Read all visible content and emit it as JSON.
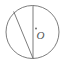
{
  "figure": {
    "kind": "geometry-diagram",
    "canvas": {
      "width": 70,
      "height": 67,
      "background": "#ffffff"
    },
    "stroke_color": "#6e6e6e",
    "label_color": "#555555",
    "stroke_width": 0.9
  },
  "circle": {
    "name": "main-circle",
    "center_x": 32.5,
    "center_y": 32.0,
    "radius": 26.5
  },
  "center_point": {
    "name": "center-dot",
    "x": 36.0,
    "y": 28.5,
    "radius": 1.0
  },
  "labels": {
    "center": "O"
  },
  "segments": [
    {
      "name": "vertical-diameter",
      "x1": 33.0,
      "y1": 5.8,
      "x2": 33.0,
      "y2": 58.3
    },
    {
      "name": "chord",
      "x1": 13.8,
      "y1": 11.8,
      "x2": 33.0,
      "y2": 58.3
    }
  ]
}
